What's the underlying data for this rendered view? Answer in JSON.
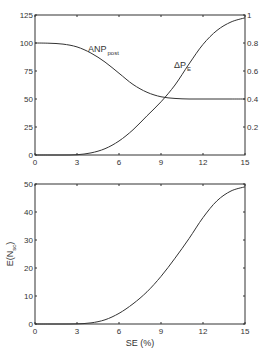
{
  "chart_data": [
    {
      "type": "line",
      "title": "",
      "xlabel": "",
      "ylabel_left": "",
      "ylabel_right": "",
      "xlim": [
        0,
        15
      ],
      "ylim_left": [
        0,
        125
      ],
      "ylim_right": [
        0,
        1
      ],
      "x_ticks": [
        "0",
        "3",
        "6",
        "9",
        "12",
        "15"
      ],
      "y_ticks_left": [
        "0",
        "25",
        "50",
        "75",
        "100",
        "125"
      ],
      "y_ticks_right": [
        "0.2",
        "0.4",
        "0.6",
        "0.8",
        "1"
      ],
      "grid": false,
      "annotations": [
        {
          "text": "ANP",
          "subscript": "post",
          "series": "ANP_post"
        },
        {
          "text": "ΔP",
          "subscript": "E",
          "series": "ΔP_E"
        }
      ],
      "x": [
        0,
        1,
        2,
        3,
        4,
        5,
        6,
        7,
        8,
        9,
        10,
        11,
        12,
        13,
        14,
        15
      ],
      "series": [
        {
          "name": "ANP_post",
          "axis": "left",
          "values": [
            100,
            99.8,
            99,
            96.5,
            91,
            83,
            73,
            63,
            56,
            52,
            50.5,
            50,
            50,
            50,
            50,
            50
          ]
        },
        {
          "name": "ΔP_E",
          "axis": "right",
          "values": [
            0,
            0,
            0,
            0.002,
            0.015,
            0.045,
            0.1,
            0.18,
            0.28,
            0.38,
            0.5,
            0.65,
            0.79,
            0.89,
            0.95,
            0.98
          ]
        }
      ]
    },
    {
      "type": "line",
      "title": "",
      "xlabel": "SE (%)",
      "ylabel": "E(N_sc)",
      "xlim": [
        0,
        15
      ],
      "ylim": [
        0,
        50
      ],
      "x_ticks": [
        "0",
        "3",
        "6",
        "9",
        "12",
        "15"
      ],
      "y_ticks": [
        "0",
        "10",
        "20",
        "30",
        "40",
        "50"
      ],
      "grid": false,
      "x": [
        0,
        1,
        2,
        3,
        4,
        5,
        6,
        7,
        8,
        9,
        10,
        11,
        12,
        13,
        14,
        15
      ],
      "series": [
        {
          "name": "E(N_sc)",
          "values": [
            0,
            0,
            0,
            0.05,
            0.4,
            1.5,
            3.8,
            7.2,
            11.5,
            17,
            23.5,
            30.5,
            38,
            44,
            47.5,
            49
          ]
        }
      ]
    }
  ],
  "labels": {
    "top": {
      "anp_main": "ANP",
      "anp_sub": "post",
      "dpe_main": "ΔP",
      "dpe_sub": "E"
    },
    "bottom": {
      "ylabel_main": "E(N",
      "ylabel_sub": "sc",
      "ylabel_end": ")",
      "xlabel": "SE (%)"
    }
  },
  "colors": {
    "line": "#333333",
    "axis": "#333333",
    "background": "#ffffff"
  }
}
